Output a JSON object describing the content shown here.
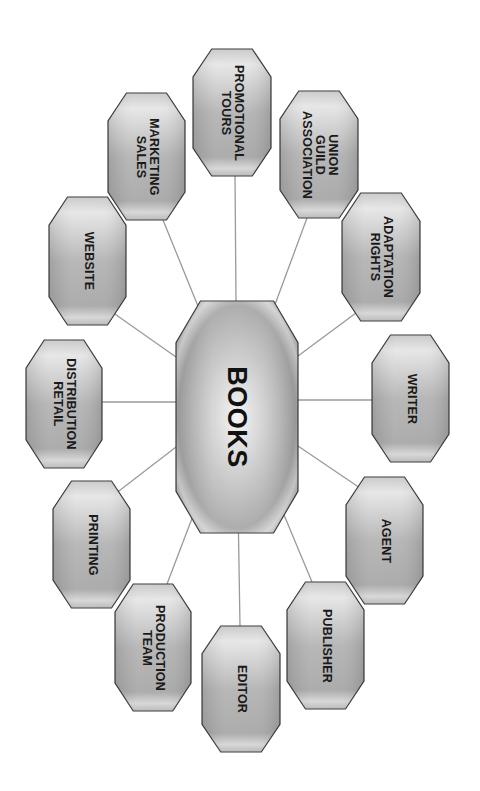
{
  "diagram": {
    "type": "hub-and-spoke",
    "orientation": "rotated 90deg clockwise",
    "colors": {
      "background": "#ffffff",
      "node_fill_light": "#e8e8e8",
      "node_fill_dark": "#a6a6a6",
      "node_border": "#3a3a3a",
      "connector": "#9a9a9a",
      "text": "#1a1a1a"
    },
    "center": {
      "id": "books",
      "label_lines": [
        "BOOKS"
      ],
      "box": {
        "x": 176,
        "y": 301,
        "w": 122,
        "h": 232
      }
    },
    "nodes": [
      {
        "id": "promotional-tours",
        "label_lines": [
          "PROMOTIONAL",
          "TOURS"
        ],
        "box": {
          "x": 193,
          "y": 49,
          "w": 78,
          "h": 127
        }
      },
      {
        "id": "union-guild-association",
        "label_lines": [
          "UNION",
          "GUILD",
          "ASSOCIATION"
        ],
        "box": {
          "x": 280,
          "y": 91,
          "w": 78,
          "h": 127
        }
      },
      {
        "id": "adaptation-rights",
        "label_lines": [
          "ADAPTATION",
          "RIGHTS"
        ],
        "box": {
          "x": 342,
          "y": 193,
          "w": 78,
          "h": 128
        }
      },
      {
        "id": "writer",
        "label_lines": [
          "WRITER"
        ],
        "box": {
          "x": 372,
          "y": 335,
          "w": 77,
          "h": 127
        }
      },
      {
        "id": "agent",
        "label_lines": [
          "AGENT"
        ],
        "box": {
          "x": 346,
          "y": 477,
          "w": 77,
          "h": 127
        }
      },
      {
        "id": "publisher",
        "label_lines": [
          "PUBLISHER"
        ],
        "box": {
          "x": 287,
          "y": 582,
          "w": 77,
          "h": 127
        }
      },
      {
        "id": "editor",
        "label_lines": [
          "EDITOR"
        ],
        "box": {
          "x": 202,
          "y": 626,
          "w": 78,
          "h": 126
        }
      },
      {
        "id": "production-team",
        "label_lines": [
          "PRODUCTION",
          "TEAM"
        ],
        "box": {
          "x": 115,
          "y": 584,
          "w": 76,
          "h": 127
        }
      },
      {
        "id": "printing",
        "label_lines": [
          "PRINTING"
        ],
        "box": {
          "x": 53,
          "y": 481,
          "w": 77,
          "h": 127
        }
      },
      {
        "id": "distribution-retail",
        "label_lines": [
          "DISTRIBUTION",
          "RETAIL"
        ],
        "box": {
          "x": 26,
          "y": 340,
          "w": 76,
          "h": 128
        }
      },
      {
        "id": "website",
        "label_lines": [
          "WEBSITE"
        ],
        "box": {
          "x": 49,
          "y": 197,
          "w": 77,
          "h": 128
        }
      },
      {
        "id": "marketing-sales",
        "label_lines": [
          "MARKETING",
          "SALES"
        ],
        "box": {
          "x": 108,
          "y": 93,
          "w": 77,
          "h": 127
        }
      }
    ],
    "connectors": [
      {
        "to": "promotional-tours",
        "x1": 236,
        "y1": 301,
        "x2": 235,
        "y2": 176
      },
      {
        "to": "union-guild-association",
        "x1": 270,
        "y1": 318,
        "x2": 307,
        "y2": 218
      },
      {
        "to": "adaptation-rights",
        "x1": 298,
        "y1": 356,
        "x2": 360,
        "y2": 310
      },
      {
        "to": "writer",
        "x1": 298,
        "y1": 400,
        "x2": 372,
        "y2": 400
      },
      {
        "to": "agent",
        "x1": 298,
        "y1": 446,
        "x2": 360,
        "y2": 488
      },
      {
        "to": "publisher",
        "x1": 272,
        "y1": 486,
        "x2": 312,
        "y2": 582
      },
      {
        "to": "editor",
        "x1": 238,
        "y1": 503,
        "x2": 240,
        "y2": 626
      },
      {
        "to": "production-team",
        "x1": 204,
        "y1": 487,
        "x2": 167,
        "y2": 584
      },
      {
        "to": "printing",
        "x1": 176,
        "y1": 447,
        "x2": 115,
        "y2": 494
      },
      {
        "to": "distribution-retail",
        "x1": 176,
        "y1": 402,
        "x2": 102,
        "y2": 402
      },
      {
        "to": "website",
        "x1": 176,
        "y1": 357,
        "x2": 112,
        "y2": 312
      },
      {
        "to": "marketing-sales",
        "x1": 202,
        "y1": 316,
        "x2": 163,
        "y2": 220
      }
    ]
  }
}
